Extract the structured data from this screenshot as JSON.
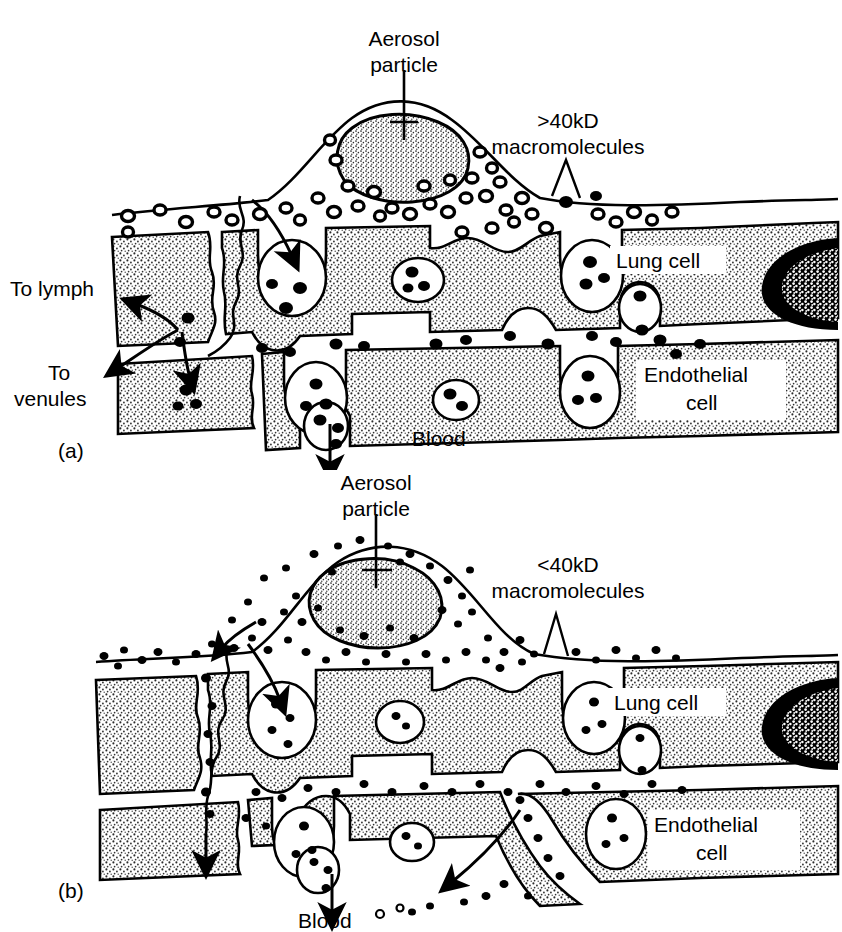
{
  "figure": {
    "type": "scientific-diagram",
    "panels": [
      {
        "id": "a",
        "letter": "(a)",
        "macromolecule_label_line1": ">40kD",
        "macromolecule_label_line2": "macromolecules",
        "aerosol_label_line1": "Aerosol",
        "aerosol_label_line2": "particle",
        "lymph_label": "To lymph",
        "venules_label_line1": "To",
        "venules_label_line2": "venules",
        "lung_cell_label": "Lung cell",
        "endothelial_label_line1": "Endothelial",
        "endothelial_label_line2": "cell",
        "blood_label": "Blood",
        "particle_style": "large-outlined-blobs",
        "transport_routes": [
          "vesicular/caveolar transcytosis",
          "paracellular junction to lymph",
          "paracellular junction to venules"
        ]
      },
      {
        "id": "b",
        "letter": "(b)",
        "macromolecule_label_line1": "<40kD",
        "macromolecule_label_line2": "macromolecules",
        "aerosol_label_line1": "Aerosol",
        "aerosol_label_line2": "particle",
        "lung_cell_label": "Lung cell",
        "endothelial_label_line1": "Endothelial",
        "endothelial_label_line2": "cell",
        "blood_label": "Blood",
        "particle_style": "small-solid-dots",
        "transport_routes": [
          "vesicular/caveolar transcytosis",
          "paracellular junction into blood",
          "direct paracellular passage to blood"
        ]
      }
    ],
    "colors": {
      "ink": "#000000",
      "background": "#ffffff",
      "cell_fill_stipple": "#b4b4b4",
      "nucleus_dark": "#000000"
    }
  }
}
